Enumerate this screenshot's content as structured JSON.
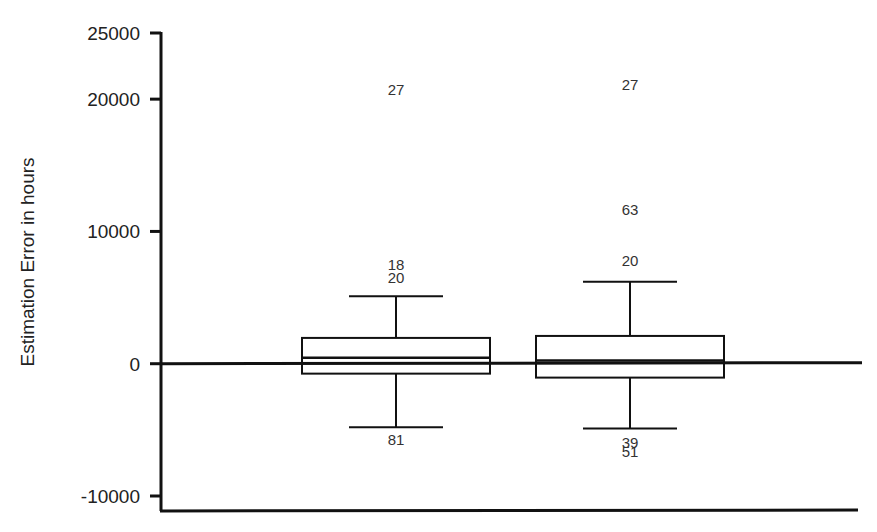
{
  "chart_data": {
    "type": "box",
    "title": "",
    "xlabel": "",
    "ylabel": "Estimation Error in hours",
    "ylim": [
      -10000,
      25000
    ],
    "yticks": [
      25000,
      20000,
      10000,
      0,
      -10000
    ],
    "ytick_labels": [
      "25000",
      "20000",
      "10000",
      "0",
      "-10000"
    ],
    "grid": false,
    "legend": null,
    "reference_line": 0,
    "categories": [
      "",
      ""
    ],
    "series": [
      {
        "name": "Group 1",
        "whisker_high": 5100,
        "q3": 1950,
        "median": 450,
        "q1": -750,
        "whisker_low": -4800,
        "outliers": [
          {
            "label": "27",
            "value": 20700
          },
          {
            "label": "18",
            "value": 7500
          },
          {
            "label": "20",
            "value": 6500
          },
          {
            "label": "81",
            "value": -5800
          }
        ]
      },
      {
        "name": "Group 2",
        "whisker_high": 6200,
        "q3": 2100,
        "median": 250,
        "q1": -1050,
        "whisker_low": -4900,
        "outliers": [
          {
            "label": "27",
            "value": 21100
          },
          {
            "label": "63",
            "value": 11600
          },
          {
            "label": "20",
            "value": 7800
          },
          {
            "label": "39",
            "value": -6000
          },
          {
            "label": "51",
            "value": -6700
          }
        ]
      }
    ]
  },
  "colors": {
    "stroke": "#111111",
    "text": "#222222",
    "background": "#ffffff"
  }
}
